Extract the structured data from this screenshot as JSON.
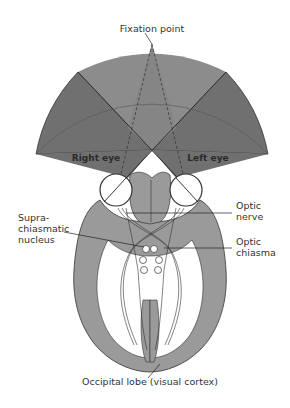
{
  "diagram": {
    "colors": {
      "binocular_field": "#8c8c8c",
      "monocular_field": "#707070",
      "brain_tissue": "#9a9a9a",
      "outline": "#333333",
      "background": "#ffffff"
    },
    "labels": {
      "fixation_point": "Fixation point",
      "right_eye": "Right eye",
      "left_eye": "Left eye",
      "optic_nerve_1": "Optic",
      "optic_nerve_2": "nerve",
      "suprachiasmatic_1": "Supra-",
      "suprachiasmatic_2": "chiasmatic",
      "suprachiasmatic_3": "nucleus",
      "optic_chiasma_1": "Optic",
      "optic_chiasma_2": "chiasma",
      "occipital_lobe": "Occipital lobe (visual cortex)"
    }
  }
}
